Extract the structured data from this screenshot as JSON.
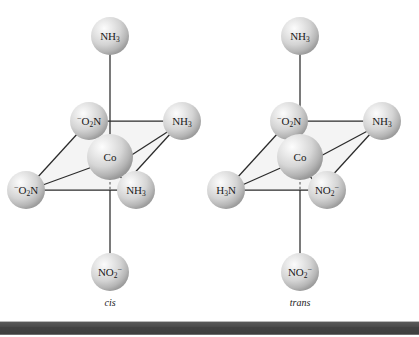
{
  "figure": {
    "background_color": "#ffffff",
    "bond_color": "#2b2b2b",
    "sphere_base_color": "#d6d6d6",
    "sphere_highlight_color": "#fbfbfb",
    "sphere_shadow_color": "#9a9a9a",
    "plane_fill_color": "#ebebeb",
    "text_color": "#1a1a1a"
  },
  "structures": [
    {
      "id": "cis",
      "caption": "cis",
      "center": {
        "label_main": "Co",
        "label_sub": "",
        "label_sup": ""
      },
      "ligands": {
        "axial_top": {
          "main": "NH",
          "sub": "3",
          "sup": "",
          "pre_sup": ""
        },
        "axial_bottom": {
          "main": "NO",
          "sub": "2",
          "sup": "−",
          "pre_sup": ""
        },
        "equatorial_back_left": {
          "main": "O",
          "sub": "2",
          "sup": "",
          "pre_sup": "−",
          "tail": "N"
        },
        "equatorial_back_right": {
          "main": "NH",
          "sub": "3",
          "sup": "",
          "pre_sup": ""
        },
        "equatorial_front_left": {
          "main": "O",
          "sub": "2",
          "sup": "",
          "pre_sup": "−",
          "tail": "N"
        },
        "equatorial_front_right": {
          "main": "NH",
          "sub": "3",
          "sup": "",
          "pre_sup": ""
        }
      }
    },
    {
      "id": "trans",
      "caption": "trans",
      "center": {
        "label_main": "Co",
        "label_sub": "",
        "label_sup": ""
      },
      "ligands": {
        "axial_top": {
          "main": "NH",
          "sub": "3",
          "sup": "",
          "pre_sup": ""
        },
        "axial_bottom": {
          "main": "NO",
          "sub": "2",
          "sup": "−",
          "pre_sup": ""
        },
        "equatorial_back_left": {
          "main": "O",
          "sub": "2",
          "sup": "",
          "pre_sup": "−",
          "tail": "N"
        },
        "equatorial_back_right": {
          "main": "NH",
          "sub": "3",
          "sup": "",
          "pre_sup": ""
        },
        "equatorial_front_left": {
          "main": "H",
          "sub": "3",
          "sup": "",
          "pre_sup": "",
          "tail": "N"
        },
        "equatorial_front_right": {
          "main": "NO",
          "sub": "2",
          "sup": "−",
          "pre_sup": ""
        }
      }
    }
  ],
  "captions": {
    "left": "cis",
    "right": "trans"
  }
}
